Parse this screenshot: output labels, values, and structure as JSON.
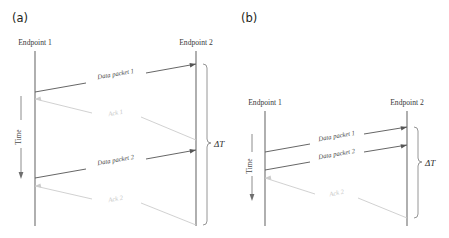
{
  "figure": {
    "background": "#ffffff",
    "colors": {
      "lifeline": "#6e6e6e",
      "data_message": "#555555",
      "ack_message": "#cccccc",
      "bracket": "#8a8a8a",
      "text": "#3a3a3a",
      "panel_tag": "#231f20"
    }
  },
  "panels": [
    {
      "tag": "(a)",
      "endpoint_left": "Endpoint 1",
      "endpoint_right": "Endpoint 2",
      "time_axis_label": "Time",
      "interval_label": "ΔT",
      "messages": [
        {
          "label": "Data packet 1",
          "kind": "data",
          "direction": "left-to-right"
        },
        {
          "label": "Ack 1",
          "kind": "ack",
          "direction": "right-to-left"
        },
        {
          "label": "Data packet 2",
          "kind": "data",
          "direction": "left-to-right"
        },
        {
          "label": "Ack 2",
          "kind": "ack",
          "direction": "right-to-left"
        }
      ]
    },
    {
      "tag": "(b)",
      "endpoint_left": "Endpoint 1",
      "endpoint_right": "Endpoint 2",
      "time_axis_label": "Time",
      "interval_label": "ΔT",
      "messages": [
        {
          "label": "Data packet 1",
          "kind": "data",
          "direction": "left-to-right"
        },
        {
          "label": "Data packet 2",
          "kind": "data",
          "direction": "left-to-right"
        },
        {
          "label": "Ack 2",
          "kind": "ack",
          "direction": "right-to-left"
        }
      ]
    }
  ]
}
